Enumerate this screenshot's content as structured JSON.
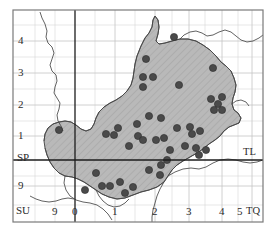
{
  "figure": {
    "type": "distribution-dot-map"
  },
  "colors": {
    "land_fill": "#ffffff",
    "distribution_fill": "#b9b9b9",
    "hatch_stroke": "#9a9a9a",
    "coastline_stroke": "#3c3c3c",
    "grid_line": "#cfcfcf",
    "axis_line": "#1a1a1a",
    "frame": "#6f6f6f",
    "dot_fill": "#4a4a4a",
    "dot_stroke": "#2b2b2b",
    "label_color": "#2b2b2b"
  },
  "grid": {
    "minor_spacing_px": 20,
    "major_spacing_px": 40,
    "origin_x_px": 75,
    "origin_y_px": 160
  },
  "axes": {
    "x_axis": {
      "name": "easting-100km-grid",
      "ticks": [
        {
          "label": "0",
          "x": 75
        },
        {
          "label": "1",
          "x": 115
        },
        {
          "label": "2",
          "x": 155
        },
        {
          "label": "3",
          "x": 189
        },
        {
          "label": "4",
          "x": 222
        },
        {
          "label": "5",
          "x": 252
        }
      ],
      "corner_label_right": "TQ",
      "corner_label_left": "SU"
    },
    "y_axis": {
      "name": "northing-100km-grid",
      "ticks": [
        {
          "label": "4",
          "y": 41
        },
        {
          "label": "3",
          "y": 73
        },
        {
          "label": "2",
          "y": 105
        },
        {
          "label": "1",
          "y": 136
        },
        {
          "label": "9",
          "y": 186
        }
      ],
      "quadrant_label_upper_left": "SP",
      "quadrant_label_lower_left": "SU",
      "quadrant_label_right": "TL"
    }
  },
  "labels": {
    "y4": "4",
    "y3": "3",
    "y2": "2",
    "y1": "1",
    "sp": "SP",
    "y9": "9",
    "su": "SU",
    "su_9": "9",
    "x0": "0",
    "x1": "1",
    "x2": "2",
    "x3": "3",
    "x4": "4",
    "x5": "5",
    "tq": "TQ",
    "tl": "TL"
  },
  "chart_data": {
    "type": "scatter",
    "title": "",
    "xlabel": "",
    "ylabel": "",
    "xlim": [
      0,
      270
    ],
    "ylim": [
      0,
      231
    ],
    "grid": true,
    "legend": null,
    "dot_radius_px": 3.6,
    "dot_count": 44,
    "points": [
      {
        "x": 146,
        "y": 59
      },
      {
        "x": 174,
        "y": 37
      },
      {
        "x": 143,
        "y": 77
      },
      {
        "x": 153,
        "y": 77
      },
      {
        "x": 143,
        "y": 87
      },
      {
        "x": 179,
        "y": 85
      },
      {
        "x": 213,
        "y": 68
      },
      {
        "x": 211,
        "y": 99
      },
      {
        "x": 222,
        "y": 97
      },
      {
        "x": 218,
        "y": 104
      },
      {
        "x": 214,
        "y": 110
      },
      {
        "x": 222,
        "y": 110
      },
      {
        "x": 137,
        "y": 124
      },
      {
        "x": 118,
        "y": 128
      },
      {
        "x": 114,
        "y": 135
      },
      {
        "x": 138,
        "y": 136
      },
      {
        "x": 129,
        "y": 146
      },
      {
        "x": 106,
        "y": 134
      },
      {
        "x": 177,
        "y": 128
      },
      {
        "x": 190,
        "y": 127
      },
      {
        "x": 192,
        "y": 134
      },
      {
        "x": 200,
        "y": 131
      },
      {
        "x": 170,
        "y": 150
      },
      {
        "x": 185,
        "y": 146
      },
      {
        "x": 196,
        "y": 148
      },
      {
        "x": 206,
        "y": 150
      },
      {
        "x": 199,
        "y": 155
      },
      {
        "x": 59,
        "y": 130
      },
      {
        "x": 143,
        "y": 140
      },
      {
        "x": 149,
        "y": 116
      },
      {
        "x": 161,
        "y": 118
      },
      {
        "x": 156,
        "y": 140
      },
      {
        "x": 164,
        "y": 138
      },
      {
        "x": 167,
        "y": 160
      },
      {
        "x": 161,
        "y": 165
      },
      {
        "x": 149,
        "y": 170
      },
      {
        "x": 160,
        "y": 175
      },
      {
        "x": 96,
        "y": 173
      },
      {
        "x": 102,
        "y": 186
      },
      {
        "x": 110,
        "y": 186
      },
      {
        "x": 85,
        "y": 190
      },
      {
        "x": 120,
        "y": 182
      },
      {
        "x": 133,
        "y": 187
      },
      {
        "x": 125,
        "y": 193
      }
    ]
  }
}
